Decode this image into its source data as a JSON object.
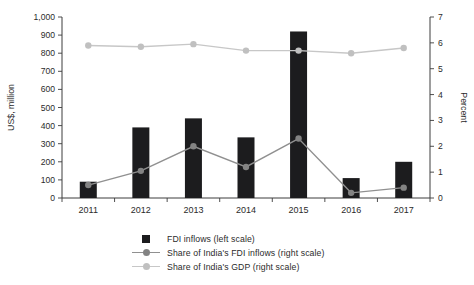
{
  "chart_data": {
    "type": "bar",
    "subtype": "combo-bar-line-dual-axis",
    "title": "",
    "categories": [
      "2011",
      "2012",
      "2013",
      "2014",
      "2015",
      "2016",
      "2017"
    ],
    "series": [
      {
        "name": "FDI inflows (left scale)",
        "kind": "bar",
        "axis": "left",
        "values": [
          90,
          390,
          440,
          335,
          920,
          110,
          200
        ],
        "color": "#1c1c1e"
      },
      {
        "name": "Share of India's FDI inflows (right scale)",
        "kind": "line",
        "axis": "right",
        "values": [
          0.5,
          1.05,
          2.0,
          1.2,
          2.3,
          0.2,
          0.4
        ],
        "color": "#909090",
        "marker_color": "#838383"
      },
      {
        "name": "Share of India's GDP (right scale)",
        "kind": "line",
        "axis": "right",
        "values": [
          5.9,
          5.85,
          5.95,
          5.7,
          5.7,
          5.6,
          5.8
        ],
        "color": "#c7c7c7",
        "marker_color": "#c0c0c0"
      }
    ],
    "left_axis": {
      "label": "US$, million",
      "min": 0,
      "max": 1000,
      "step": 100,
      "tick_labels": [
        "0",
        "100",
        "200",
        "300",
        "400",
        "500",
        "600",
        "700",
        "800",
        "900",
        "1,000"
      ]
    },
    "right_axis": {
      "label": "Percent",
      "min": 0,
      "max": 7,
      "step": 1,
      "tick_labels": [
        "0",
        "1",
        "2",
        "3",
        "4",
        "5",
        "6",
        "7"
      ]
    },
    "grid": false,
    "legend_position": "bottom-left",
    "colors": {
      "axis": "#3c3c3c",
      "tick_text": "#2b2b2b",
      "background": "#ffffff"
    }
  }
}
